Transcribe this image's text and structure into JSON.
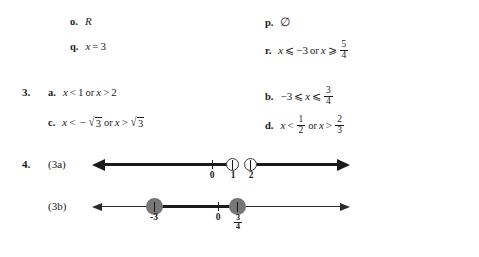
{
  "page": {
    "background_color": "#ffffff",
    "text_color": "#1a1a1a"
  },
  "exercises": [
    {
      "label": "o.",
      "answer_text": "R",
      "column": "left",
      "row": 1
    },
    {
      "label": "p.",
      "answer_text": "∅",
      "column": "right",
      "row": 1
    },
    {
      "label": "q.",
      "answer_text": "x = 3",
      "column": "left",
      "row": 2
    },
    {
      "label": "r.",
      "answer_text": "x ⩽ −3 or x ⩾ 5/4",
      "column": "right",
      "row": 2
    }
  ],
  "q_o": {
    "label": "o.",
    "value": "R"
  },
  "q_p": {
    "label": "p.",
    "value": "∅"
  },
  "q_q": {
    "label": "q.",
    "var": "x",
    "relation": "=",
    "value": "3"
  },
  "q_r": {
    "label": "r.",
    "var1": "x",
    "rel1": "⩽",
    "val1": "−3",
    "conj": "or",
    "var2": "x",
    "rel2": "⩾",
    "frac_num": "5",
    "frac_den": "4"
  },
  "question3": {
    "number": "3.",
    "a": {
      "label": "a.",
      "var1": "x",
      "rel1": "<",
      "val1": "1",
      "conj": "or",
      "var2": "x",
      "rel2": ">",
      "val2": "2"
    },
    "b": {
      "label": "b.",
      "val1": "−3",
      "rel1": "⩽",
      "var": "x",
      "rel2": "⩽",
      "frac_num": "3",
      "frac_den": "4"
    },
    "c": {
      "label": "c.",
      "var1": "x",
      "rel1": "<",
      "minus": "−",
      "radicand1": "3",
      "conj": "or",
      "var2": "x",
      "rel2": ">",
      "radicand2": "3"
    },
    "d": {
      "label": "d.",
      "var1": "x",
      "rel1": "<",
      "frac1_num": "1",
      "frac1_den": "2",
      "conj": "or",
      "var2": "x",
      "rel2": ">",
      "frac2_num": "2",
      "frac2_den": "3"
    }
  },
  "question4": {
    "number": "4.",
    "figures": [
      {
        "caption": "(3a)",
        "type": "number-line",
        "endpoint_style": "open",
        "ticks": [
          {
            "label": "0",
            "kind": "tick"
          },
          {
            "label": "1",
            "kind": "open-circle"
          },
          {
            "label": "2",
            "kind": "open-circle"
          }
        ],
        "shaded": "x < 1 or x > 2",
        "left_arrow": true,
        "right_arrow": true
      },
      {
        "caption": "(3b)",
        "type": "number-line",
        "endpoint_style": "closed",
        "ticks": [
          {
            "label": "-3",
            "kind": "closed-circle"
          },
          {
            "label": "0",
            "kind": "tick"
          },
          {
            "label": "3/4",
            "kind": "closed-circle",
            "frac_num": "3",
            "frac_den": "4"
          }
        ],
        "shaded": "-3 ⩽ x ⩽ 3/4",
        "left_arrow": true,
        "right_arrow": true
      }
    ],
    "fig_a": {
      "caption": "(3a)",
      "tick0": "0",
      "tick1": "1",
      "tick2": "2"
    },
    "fig_b": {
      "caption": "(3b)",
      "tick_neg3": "-3",
      "tick0": "0",
      "frac_num": "3",
      "frac_den": "4"
    }
  }
}
